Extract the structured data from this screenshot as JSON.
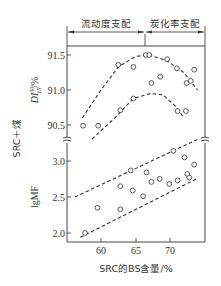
{
  "chart_data": [
    {
      "type": "scatter",
      "panel": "upper",
      "ylabel": "DI 30/15 /%",
      "xlabel": "SRC的BS含量/%",
      "yticks": [
        90.5,
        91.0,
        91.5
      ],
      "ylim": [
        90.3,
        91.65
      ],
      "xticks": [
        60,
        65,
        70
      ],
      "xlim": [
        55,
        75
      ],
      "regions": [
        {
          "label": "流动度支配",
          "x_range": [
            55,
            66.4
          ]
        },
        {
          "label": "炭化率支配",
          "x_range": [
            66.4,
            75
          ]
        }
      ],
      "series": [
        {
          "name": "upper_curve_points",
          "points": [
            [
              57.4,
              90.49
            ],
            [
              59.6,
              90.49
            ],
            [
              62.5,
              91.36
            ],
            [
              64.7,
              91.33
            ],
            [
              66.5,
              91.5
            ],
            [
              67.0,
              91.5
            ],
            [
              67.3,
              91.1
            ],
            [
              68.6,
              91.19
            ],
            [
              69.6,
              91.44
            ],
            [
              71.0,
              91.31
            ],
            [
              72.4,
              91.1
            ],
            [
              73.0,
              91.13
            ],
            [
              73.5,
              91.29
            ]
          ]
        },
        {
          "name": "lower_curve_points",
          "points": [
            [
              62.8,
              90.71
            ],
            [
              64.7,
              90.88
            ],
            [
              71.1,
              90.7
            ],
            [
              72.3,
              90.7
            ]
          ]
        }
      ],
      "fit_lines": [
        {
          "name": "upper_dashed_curve",
          "style": "dashed",
          "points": [
            [
              57.3,
              90.6
            ],
            [
              60,
              91.0
            ],
            [
              62.5,
              91.33
            ],
            [
              65,
              91.48
            ],
            [
              67,
              91.5
            ],
            [
              69.5,
              91.42
            ],
            [
              72,
              91.25
            ],
            [
              74,
              91.0
            ]
          ]
        },
        {
          "name": "lower_dashed_curve",
          "style": "dashed",
          "points": [
            [
              58.7,
              90.3
            ],
            [
              62,
              90.6
            ],
            [
              64.7,
              90.88
            ],
            [
              67.2,
              90.95
            ],
            [
              69,
              90.93
            ],
            [
              71,
              90.75
            ],
            [
              72,
              90.6
            ]
          ]
        }
      ]
    },
    {
      "type": "scatter",
      "panel": "lower",
      "ylabel": "lgMF",
      "xlabel": "SRC的BS含量/%",
      "yticks": [
        2.0,
        2.5,
        3.0
      ],
      "ylim": [
        1.95,
        3.3
      ],
      "xticks": [
        60,
        65,
        70
      ],
      "xlim": [
        55,
        75
      ],
      "series": [
        {
          "name": "lgMF_points",
          "points": [
            [
              57.7,
              2.0
            ],
            [
              59.5,
              2.35
            ],
            [
              62.8,
              2.65
            ],
            [
              62.8,
              2.33
            ],
            [
              64.3,
              2.87
            ],
            [
              64.6,
              2.59
            ],
            [
              66.1,
              2.51
            ],
            [
              66.6,
              2.84
            ],
            [
              67.3,
              2.71
            ],
            [
              68.5,
              2.75
            ],
            [
              69.9,
              2.68
            ],
            [
              70.5,
              3.14
            ],
            [
              71.1,
              2.73
            ],
            [
              72.1,
              3.05
            ],
            [
              72.5,
              2.82
            ],
            [
              72.8,
              2.77
            ],
            [
              73.5,
              2.95
            ]
          ]
        }
      ],
      "fit_lines": [
        {
          "name": "upper_bound_line",
          "style": "dashed",
          "points": [
            [
              56.2,
              2.5
            ],
            [
              74,
              3.3
            ]
          ]
        },
        {
          "name": "lower_bound_line",
          "style": "dashed",
          "points": [
            [
              57,
              1.94
            ],
            [
              74,
              2.76
            ]
          ]
        }
      ]
    }
  ],
  "labels": {
    "region_left": "流动度支配",
    "region_right": "炭化率支配",
    "y_group_label": "SRC＋煤",
    "y_upper_label_main": "DI",
    "y_upper_label_sup": "30",
    "y_upper_label_sub": "15",
    "y_upper_label_unit": "/%",
    "y_lower_label": "lgMF",
    "x_label": "SRC的BS含量/%",
    "yticks_upper": [
      "91.5",
      "91.0",
      "90.5"
    ],
    "yticks_lower": [
      "3.0",
      "2.5",
      "2.0"
    ],
    "xticks": [
      "60",
      "65",
      "70"
    ]
  },
  "colors": {
    "ink": "#333333",
    "background": "#ffffff"
  }
}
